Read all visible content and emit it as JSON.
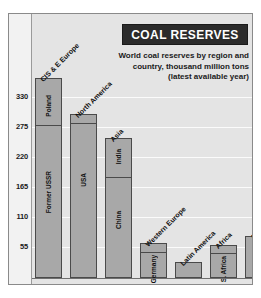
{
  "chart_data": {
    "type": "bar",
    "title": "COAL RESERVES",
    "subtitle_lines": [
      "World coal reserves by region and",
      "country, thousand million tons",
      "(latest available year)"
    ],
    "xlabel": "",
    "ylabel": "thousand million tons",
    "ylim": [
      0,
      385
    ],
    "grid": true,
    "legend": "none",
    "yticks": [
      55,
      110,
      165,
      220,
      275,
      330
    ],
    "ytick_labels": [
      "55",
      "110",
      "165",
      "220",
      "275",
      "330"
    ],
    "categories": [
      "CIS & E Europe",
      "North America",
      "Asia",
      "Western Europe",
      "Latin America",
      "Africa",
      "Australasia"
    ],
    "values": [
      365,
      299,
      255,
      62,
      28,
      59,
      75
    ],
    "stacked_segments": [
      {
        "group": "CIS & E Europe",
        "segments": [
          {
            "name": "Poland",
            "value": 85
          },
          {
            "name": "Former USSR",
            "value": 280
          }
        ]
      },
      {
        "group": "North America",
        "segments": [
          {
            "name": "USA",
            "value": 299
          }
        ]
      },
      {
        "group": "Asia",
        "segments": [
          {
            "name": "India",
            "value": 70
          },
          {
            "name": "China",
            "value": 185
          }
        ]
      },
      {
        "group": "Western Europe",
        "segments": [
          {
            "name": "Germany",
            "value": 48
          }
        ]
      },
      {
        "group": "Latin America",
        "segments": []
      },
      {
        "group": "Africa",
        "segments": [
          {
            "name": "S. Africa",
            "value": 55
          }
        ]
      },
      {
        "group": "Australasia",
        "segments": []
      }
    ]
  },
  "labels": {
    "tick_330": "330",
    "tick_275": "275",
    "tick_220": "220",
    "tick_165": "165",
    "tick_110": "110",
    "tick_55": "55",
    "grp_cis": "CIS & E Europe",
    "grp_north_america": "North America",
    "grp_asia": "Asia",
    "grp_western_europe": "Western Europe",
    "grp_latin_america": "Latin America",
    "grp_africa": "Africa",
    "grp_australasia": "Australasia",
    "seg_poland": "Poland",
    "seg_former_ussr": "Former USSR",
    "seg_usa": "USA",
    "seg_india": "India",
    "seg_china": "China",
    "seg_germany": "Germany",
    "seg_s_africa": "S. Africa"
  },
  "title": {
    "text": "COAL RESERVES"
  },
  "subtitle": {
    "line1": "World coal reserves by region and",
    "line2": "country, thousand million tons",
    "line3": "(latest available year)"
  },
  "colors": {
    "title_bg": "#2b2b2b",
    "title_fg": "#ffffff",
    "bar_fill": "#a8a8a8",
    "bar_stroke": "#4a4a4a",
    "panel_bg": "#e4e4e4",
    "gridline": "#fbfbfb",
    "frame": "#8a8a8a",
    "text": "#1a1a1a"
  }
}
